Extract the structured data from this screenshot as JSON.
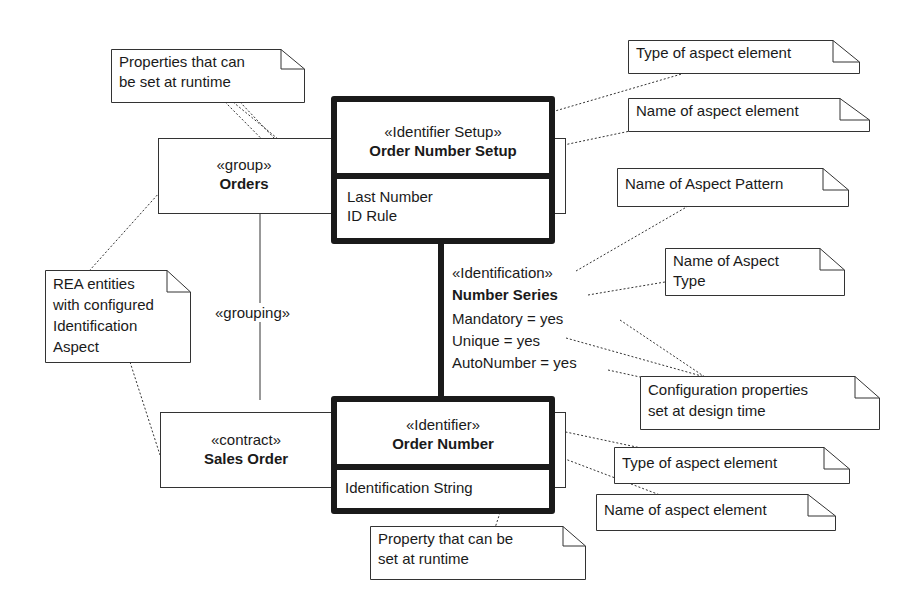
{
  "elements": {
    "identifier_setup": {
      "stereotype": "«Identifier Setup»",
      "name": "Order Number Setup",
      "attributes": [
        "Last Number",
        "ID Rule"
      ]
    },
    "group": {
      "stereotype": "«group»",
      "name": "Orders"
    },
    "contract": {
      "stereotype": "«contract»",
      "name": "Sales Order"
    },
    "identifier": {
      "stereotype": "«Identifier»",
      "name": "Order Number",
      "attributes": [
        "Identification String"
      ]
    },
    "association": {
      "stereotype": "«Identification»",
      "name": "Number Series",
      "properties": [
        "Mandatory = yes",
        "Unique = yes",
        "AutoNumber = yes"
      ]
    },
    "grouping_link": {
      "label": "«grouping»"
    }
  },
  "notes": {
    "runtime_props": "Properties that can\nbe set at runtime",
    "type_top": "Type of aspect element",
    "name_top": "Name of aspect element",
    "pattern": "Name of Aspect Pattern",
    "aspect_type": "Name of Aspect\nType",
    "rea": "REA entities\nwith configured\nIdentification\nAspect",
    "config": "Configuration properties\nset at design time",
    "type_bottom": "Type of aspect element",
    "name_bottom": "Name of aspect element",
    "runtime_prop": "Property that can be\nset at runtime"
  }
}
